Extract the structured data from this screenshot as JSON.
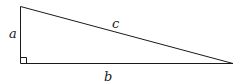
{
  "diagram": {
    "type": "right-triangle",
    "labels": {
      "vertical_leg": "a",
      "horizontal_leg": "b",
      "hypotenuse": "c"
    },
    "right_angle_marker": true,
    "stroke_color": "#1a1a1a"
  }
}
